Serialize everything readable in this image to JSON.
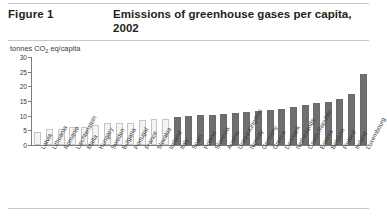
{
  "header": {
    "figure_number": "Figure 1",
    "title": "Emissions of greenhouse gases per capita, 2002"
  },
  "chart_data": {
    "type": "bar",
    "title": "Emissions of greenhouse gases per capita, 2002",
    "subtitle": "",
    "xlabel": "",
    "ylabel": "tonnes CO2 eq/capita",
    "ylabel_rich": "tonnes CO₂ eq/capita",
    "ylim": [
      0,
      30
    ],
    "yticks": [
      0,
      5,
      10,
      15,
      20,
      25,
      30
    ],
    "grid": false,
    "legend": "none",
    "categories": [
      "Latvia",
      "Lithuania",
      "Romania",
      "Liechtenstein",
      "Malta",
      "Hungary",
      "Sweden",
      "Bulgaria",
      "Portugal",
      "France",
      "Slovakia",
      "Iceland",
      "Italy",
      "Spain",
      "Poland",
      "Slovenia",
      "Austria",
      "United Kingdom",
      "Norway",
      "Germany",
      "Greece",
      "Denmark",
      "Netherlands",
      "Czech Republic",
      "Estonia",
      "Belgium",
      "Finland",
      "Ireland",
      "Luxembourg"
    ],
    "values": [
      4.3,
      5.4,
      5.6,
      6.0,
      6.2,
      6.8,
      7.4,
      7.5,
      7.6,
      8.6,
      8.8,
      9.0,
      9.6,
      9.8,
      10.1,
      10.2,
      10.5,
      10.9,
      11.2,
      11.5,
      11.9,
      12.2,
      13.0,
      13.5,
      14.2,
      14.6,
      15.6,
      17.3,
      24.2
    ],
    "series_styles": [
      "light",
      "light",
      "light",
      "light",
      "light",
      "light",
      "light",
      "light",
      "light",
      "light",
      "light",
      "light",
      "dark",
      "dark",
      "dark",
      "dark",
      "dark",
      "dark",
      "dark",
      "dark",
      "dark",
      "dark",
      "dark",
      "dark",
      "dark",
      "dark",
      "dark",
      "dark",
      "dark"
    ],
    "colors": {
      "bar_light_fill": "#f4f4f4",
      "bar_light_border": "#c6c6c6",
      "bar_dark_fill": "#6f6f6f",
      "axis": "#7d7d7d",
      "text": "#231f20",
      "rule": "#c9c9c9"
    }
  }
}
